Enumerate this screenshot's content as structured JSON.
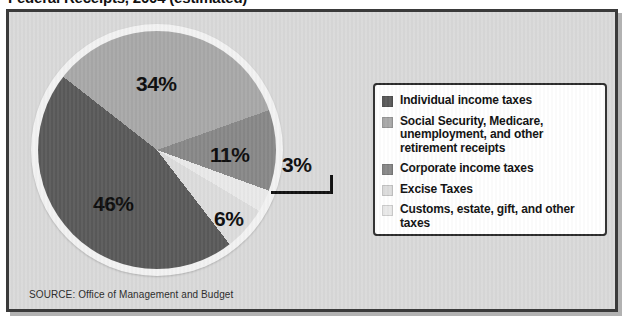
{
  "title": "Federal Receipts, 2004 (estimated)",
  "source_note": "SOURCE: Office of Management and Budget",
  "legend": {
    "items": [
      {
        "label": "Individual income taxes",
        "color": "#5a5a5a"
      },
      {
        "label": "Social Security, Medicare, unemployment, and other retirement receipts",
        "color": "#a8a8a8"
      },
      {
        "label": "Corporate income taxes",
        "color": "#888888"
      },
      {
        "label": "Excise Taxes",
        "color": "#dcdcdc"
      },
      {
        "label": "Customs, estate, gift, and other taxes",
        "color": "#e9e9e9"
      }
    ]
  },
  "labels": {
    "l46": "46%",
    "l34": "34%",
    "l11": "11%",
    "l6": "6%",
    "l3": "3%"
  },
  "chart_data": {
    "type": "pie",
    "title": "Federal Receipts, 2004 (estimated)",
    "categories": [
      "Individual income taxes",
      "Social Security, Medicare, unemployment, and other retirement receipts",
      "Corporate income taxes",
      "Excise Taxes",
      "Customs, estate, gift, and other taxes"
    ],
    "values": [
      46,
      34,
      11,
      6,
      3
    ],
    "value_labels": [
      "46%",
      "34%",
      "11%",
      "6%",
      "3%"
    ],
    "colors": [
      "#5a5a5a",
      "#a8a8a8",
      "#888888",
      "#dcdcdc",
      "#e9e9e9"
    ],
    "units": "percent",
    "total": 100,
    "legend_position": "right",
    "grid": false,
    "annotations": [
      "SOURCE: Office of Management and Budget"
    ]
  }
}
